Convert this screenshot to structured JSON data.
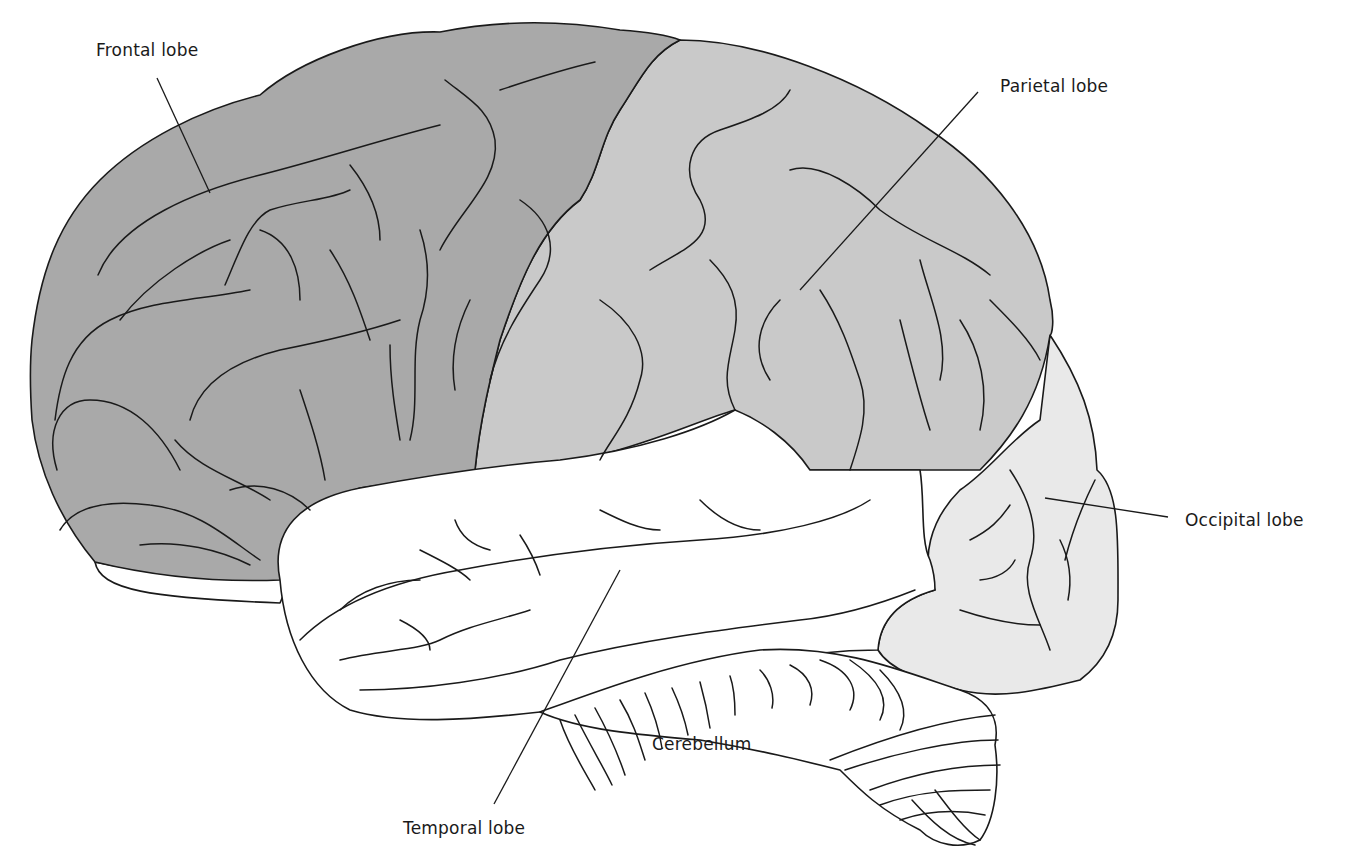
{
  "diagram": {
    "labels": {
      "frontal": "Frontal lobe",
      "parietal": "Parietal lobe",
      "occipital": "Occipital lobe",
      "temporal": "Temporal lobe",
      "cerebellum": "Cerebellum"
    },
    "colors": {
      "frontal": "#a9a9a9",
      "parietal": "#c9c9c9",
      "occipital": "#e9e9e9",
      "temporal": "#ffffff",
      "cerebellum": "#ffffff",
      "line": "#1a1a1a"
    }
  }
}
